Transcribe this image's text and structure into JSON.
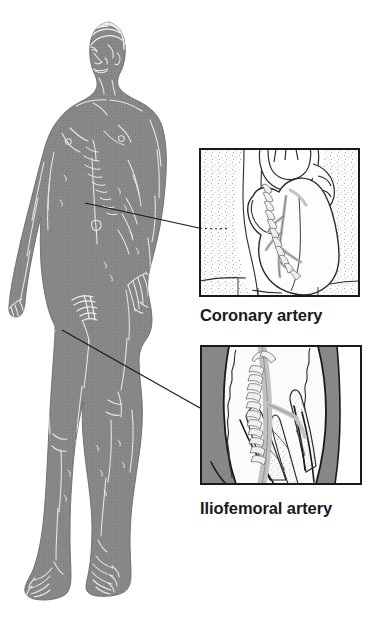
{
  "illustration": {
    "title": "Arterial access sites for catheterization",
    "subject": "standing male anatomical figure with two magnified artery insets",
    "background_color": "#ffffff"
  },
  "body_figure": {
    "name": "standing-male-figure",
    "fill_color": "#878787",
    "line_color": "#e8e8e8",
    "outline_color": "#6f6f6f",
    "pose": "standing, frontal, arms at sides, head turned to viewer left"
  },
  "callouts": [
    {
      "id": "coronary",
      "label": "Coronary artery",
      "leader_line": {
        "from_x": 85,
        "from_y": 203,
        "to_x": 199,
        "to_y": 228,
        "color": "#1a1a1a",
        "width": 1.2
      },
      "anatomy_site": "chest / heart",
      "panel": {
        "x": 199,
        "y": 148,
        "width": 161,
        "height": 149,
        "border_color": "#1a1a1a",
        "border_width": 2,
        "background_color": "#ffffff",
        "tissue_fill": "#fbfbfb",
        "stent_color": "#c9c9c9",
        "stipple_color": "#9a9a9a",
        "contents": "anterior view of the heart with great vessels, a stented coronary artery running down the anterior surface, and stippled lung tissue on both sides"
      }
    },
    {
      "id": "iliofemoral",
      "label": "Iliofemoral artery",
      "leader_line": {
        "from_x": 62,
        "from_y": 330,
        "to_x": 200,
        "to_y": 408,
        "color": "#1a1a1a",
        "width": 1.2
      },
      "anatomy_site": "groin / upper thigh",
      "panel": {
        "x": 200,
        "y": 345,
        "width": 162,
        "height": 140,
        "border_color": "#1a1a1a",
        "border_width": 2,
        "background_color": "#ffffff",
        "tissue_fill": "#f7f7f7",
        "surround_fill": "#878787",
        "stent_color": "#c9c9c9",
        "contents": "dissected upper thigh showing the iliofemoral artery with an indwelling stent, surrounded by muscle bellies and fascia"
      }
    }
  ],
  "colors": {
    "ink": "#1a1a1a",
    "body_gray": "#878787",
    "stent_gray": "#c9c9c9",
    "page_white": "#ffffff"
  }
}
